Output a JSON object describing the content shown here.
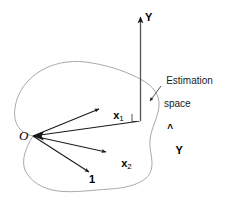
{
  "figure": {
    "type": "vector-geometry-diagram",
    "background_color": "#ffffff",
    "stroke_color": "#1a1a1a",
    "blob_color": "#a9a9a9",
    "labels": {
      "origin": "O",
      "response_vector": "Y",
      "fitted_vector_base": "Y",
      "fitted_vector_hat": "^",
      "regressor_1_base": "x",
      "regressor_1_sub": "1",
      "regressor_2_base": "x",
      "regressor_2_sub": "2",
      "constant_vector": "1",
      "annotation_line_1": "Estimation",
      "annotation_line_2": "space"
    }
  }
}
